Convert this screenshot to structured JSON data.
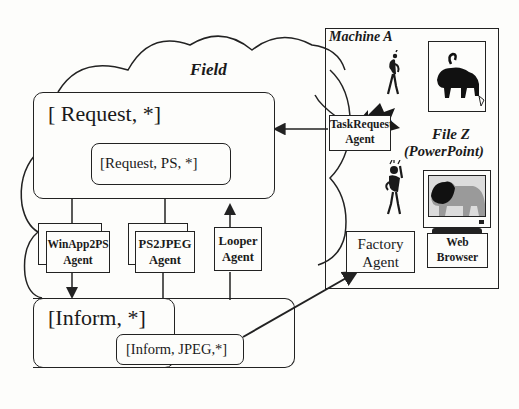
{
  "field": {
    "title": "Field",
    "request_outer": "[ Request, *]",
    "request_inner": "[Request, PS, *]",
    "inform_outer": "[Inform, *]",
    "inform_inner": "[Inform, JPEG,*]"
  },
  "agents": {
    "winapp2ps": {
      "line1": "WinApp2PS",
      "line2": "Agent"
    },
    "ps2jpeg": {
      "line1": "PS2JPEG",
      "line2": "Agent"
    },
    "looper": {
      "line1": "Looper",
      "line2": "Agent"
    }
  },
  "machine": {
    "title": "Machine A",
    "task_request": {
      "line1": "TaskRequest",
      "line2": "Agent"
    },
    "factory": {
      "line1": "Factory",
      "line2": "Agent"
    },
    "file_label": "File Z",
    "file_sublabel": "(PowerPoint)",
    "browser": {
      "line1": "Web",
      "line2": "Browser"
    }
  },
  "colors": {
    "ink": "#222222",
    "paper": "#fdfdfb",
    "screen_gray": "#9a9a9a"
  }
}
